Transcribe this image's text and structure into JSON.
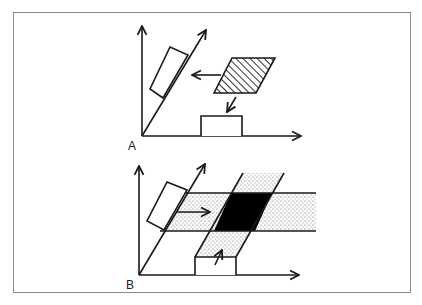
{
  "figure": {
    "panels": [
      {
        "label": "A",
        "description": "Hatched square projects leftward onto the diagonal axis and downward onto the horizontal axis as rectangles",
        "elements": [
          "vertical-axis",
          "diagonal-axis",
          "horizontal-axis",
          "tilted-rectangle-projection",
          "hatched-parallelogram",
          "arrow-left",
          "arrow-down-left",
          "bottom-rectangle-projection"
        ]
      },
      {
        "label": "B",
        "description": "Back-projection: stippled bands from both projections intersect to form the solid black region",
        "elements": [
          "vertical-axis",
          "diagonal-axis",
          "horizontal-axis",
          "tilted-rectangle-projection",
          "horizontal-stippled-band",
          "slanted-stippled-band",
          "black-intersection",
          "arrow-right",
          "arrow-up-right",
          "bottom-rectangle-projection"
        ]
      }
    ],
    "colors": {
      "line": "#1a1a1a",
      "frame": "#8a8a8a",
      "stipple": "#c8c8c8",
      "intersection": "#000000"
    }
  }
}
